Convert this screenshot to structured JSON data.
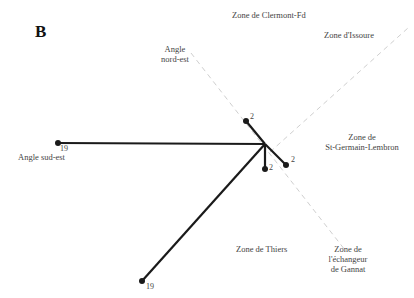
{
  "panel_label": "B",
  "zones": {
    "clermont": "Zone de Clermont-Fd",
    "issoire": "Zone d'Issoure",
    "st_germain_l1": "Zone de",
    "st_germain_l2": "St-Germain-Lembron",
    "thiers": "Zone de Thiers",
    "gannat_l1": "Zone de",
    "gannat_l2": "l'échangeur",
    "gannat_l3": "de Gannat"
  },
  "angles": {
    "nord_est_l1": "Angle",
    "nord_est_l2": "nord-est",
    "sud_est": "Angle sud-est"
  },
  "edge_weights": {
    "west": "19",
    "southwest": "19",
    "north": "2",
    "south": "2",
    "southeast": "2"
  },
  "colors": {
    "edge": "#1a1a1a",
    "dashed_axis": "#c8c8c8"
  }
}
